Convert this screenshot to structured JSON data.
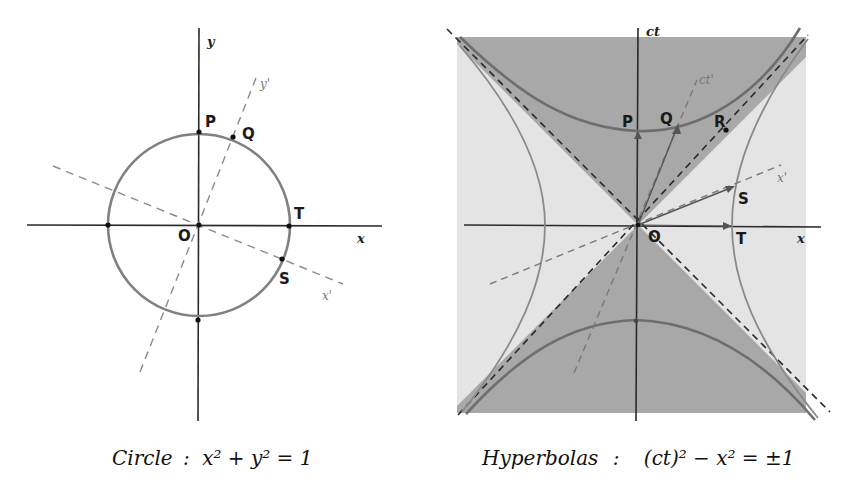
{
  "circle_figure": {
    "axes": {
      "x": "x",
      "y": "y",
      "x_prime": "x'",
      "y_prime": "y'"
    },
    "points": {
      "origin": "O",
      "P": "P",
      "Q": "Q",
      "T": "T",
      "S": "S"
    },
    "caption": {
      "label": "Circle",
      "separator": ":",
      "equation": "x² + y² = 1"
    }
  },
  "hyperbola_figure": {
    "axes": {
      "x": "x",
      "ct": "ct",
      "x_prime": "x'",
      "ct_prime": "ct'"
    },
    "points": {
      "origin": "O",
      "P": "P",
      "Q": "Q",
      "R": "R",
      "S": "S",
      "T": "T"
    },
    "caption": {
      "label": "Hyperbolas",
      "separator": ":",
      "equation": "(ct)² − x² = ±1"
    },
    "colors": {
      "background_region": "#e4e4e4",
      "timelike_region": "#a8a8a8",
      "curve": "#707070",
      "axis": "#2a2a2a"
    }
  }
}
